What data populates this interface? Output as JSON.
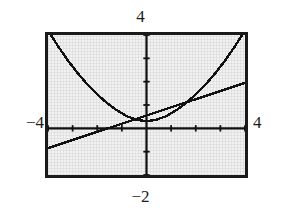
{
  "figure": {
    "kind": "graphing-calculator-screen",
    "labels": {
      "top": "4",
      "bottom": "−2",
      "left": "−4",
      "right": "4"
    },
    "colors": {
      "screen_background": "#f1f1f1",
      "frame": "#1a1a1a",
      "curve": "#111111",
      "axis": "#111111",
      "page_background": "#ffffff"
    }
  },
  "chart_data": {
    "type": "line",
    "title": "",
    "xlabel": "",
    "ylabel": "",
    "xlim": [
      -4,
      4
    ],
    "ylim": [
      -2,
      4
    ],
    "grid": false,
    "legend_position": "none",
    "axes": {
      "x_axis_visible": true,
      "y_axis_visible": true,
      "x_tick_spacing": 1,
      "y_tick_spacing": 1,
      "x_ticks": [
        -4,
        -3,
        -2,
        -1,
        0,
        1,
        2,
        3,
        4
      ],
      "y_ticks": [
        -2,
        -1,
        0,
        1,
        2,
        3,
        4
      ],
      "tick_style": "hash-marks",
      "origin": [
        0,
        0
      ]
    },
    "annotations": {
      "top_label": "4",
      "bottom_label": "−2",
      "left_label": "−4",
      "right_label": "4"
    },
    "series": [
      {
        "name": "parabola",
        "style": "dotted-pixel-trace",
        "x": [
          -4,
          -3.6,
          -3.2,
          -2.8,
          -2.4,
          -2,
          -1.6,
          -1.2,
          -0.8,
          -0.4,
          0,
          0.4,
          0.8,
          1.2,
          1.6,
          2,
          2.4,
          2.8,
          3.2,
          3.6,
          4
        ],
        "y": [
          4.2,
          3.53,
          2.92,
          2.37,
          1.88,
          1.45,
          1.08,
          0.77,
          0.52,
          0.37,
          0.3,
          0.37,
          0.52,
          0.77,
          1.08,
          1.45,
          1.88,
          2.37,
          2.92,
          3.53,
          4.2
        ]
      },
      {
        "name": "line",
        "style": "dotted-pixel-trace",
        "x": [
          -4,
          -3,
          -2,
          -1,
          0,
          1,
          2,
          3,
          4
        ],
        "y": [
          -0.85,
          -0.5,
          -0.15,
          0.2,
          0.55,
          0.9,
          1.25,
          1.6,
          1.95
        ]
      }
    ],
    "intersections": [
      {
        "x": -1.0,
        "y": 0.2
      },
      {
        "x": 1.45,
        "y": 1.06
      }
    ]
  }
}
